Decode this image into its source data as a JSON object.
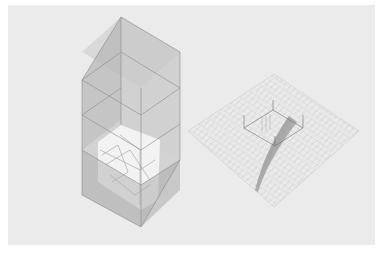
{
  "artwork": {
    "subject": "axonometric architectural drawings",
    "background_color": "#ebebeb",
    "margin_color": "#ffffff",
    "figures": [
      {
        "name": "translucent-prism",
        "description": "tall translucent box with fragmented floor plan inside"
      },
      {
        "name": "grid-plane-with-cube",
        "description": "diamond grid plane with wireframe cube and curved ramp"
      }
    ]
  }
}
